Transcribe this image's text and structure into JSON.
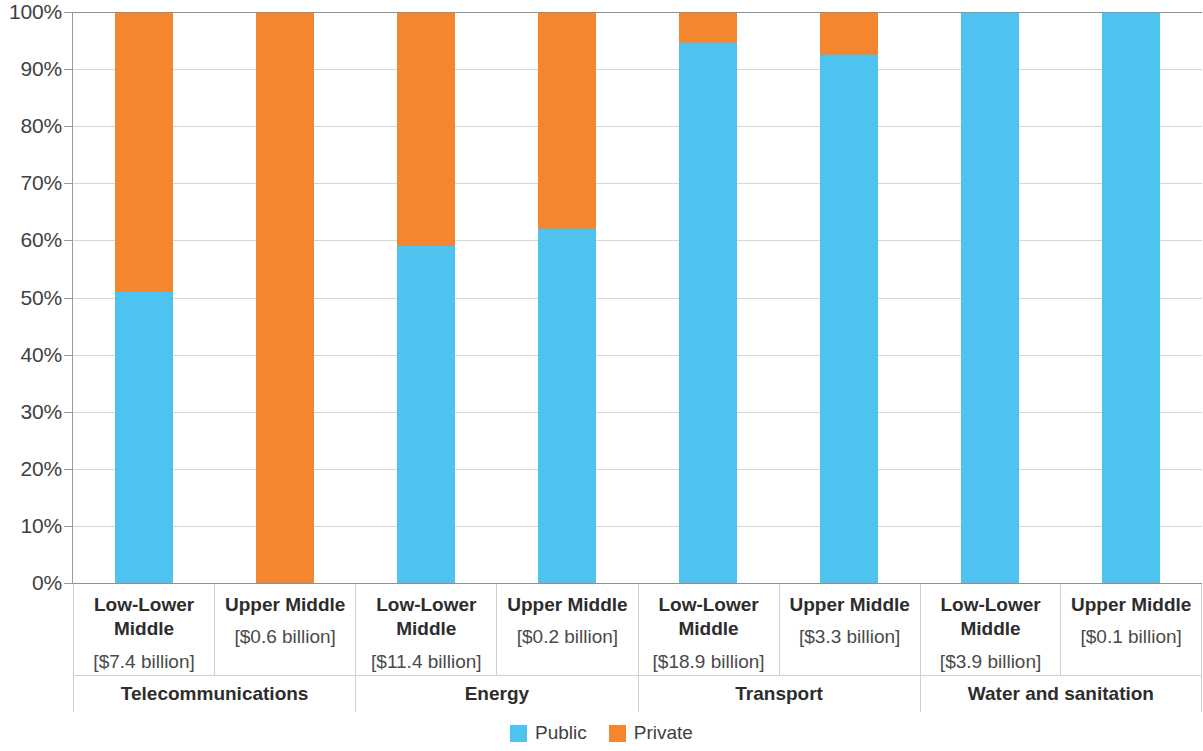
{
  "chart_data": {
    "type": "bar",
    "subtype": "stacked-100-percent",
    "title": "",
    "xlabel": "",
    "ylabel": "",
    "ylim": [
      0,
      100
    ],
    "grid": true,
    "legend_position": "bottom",
    "y_tick_labels": [
      "100%",
      "90%",
      "80%",
      "70%",
      "60%",
      "50%",
      "40%",
      "30%",
      "20%",
      "10%",
      "0%"
    ],
    "y_tick_values": [
      100,
      90,
      80,
      70,
      60,
      50,
      40,
      30,
      20,
      10,
      0
    ],
    "categories": [
      "Low-Lower Middle",
      "Upper Middle",
      "Low-Lower Middle",
      "Upper Middle",
      "Low-Lower Middle",
      "Upper Middle",
      "Low-Lower Middle",
      "Upper Middle"
    ],
    "series": [
      {
        "name": "Public",
        "color": "#4fc3ef",
        "values": [
          51,
          0,
          59,
          62,
          94.5,
          92.5,
          100,
          100
        ]
      },
      {
        "name": "Private",
        "color": "#f4862f",
        "values": [
          49,
          100,
          41,
          38,
          5.5,
          7.5,
          0,
          0
        ]
      }
    ],
    "annotations": [
      "[$7.4 billion]",
      "[$0.6 billion]",
      "[$11.4 billion]",
      "[$0.2 billion]",
      "[$18.9 billion]",
      "[$3.3 billion]",
      "[$3.9 billion]",
      "[$0.1 billion]"
    ]
  },
  "colors": {
    "public": "#4fc3ef",
    "private": "#f4862f",
    "gridline": "#d6d6d6",
    "axis": "#8f8f8f",
    "text": "#3f3f3f"
  },
  "legend": {
    "items": [
      {
        "label": "Public",
        "color": "#4fc3ef"
      },
      {
        "label": "Private",
        "color": "#f4862f"
      }
    ]
  },
  "groups": [
    {
      "name": "Telecommunications",
      "subgroups": [
        {
          "name": "Low-Lower Middle",
          "amount": "[$7.4 billion]",
          "public": 51,
          "private": 49
        },
        {
          "name": "Upper Middle",
          "amount": "[$0.6 billion]",
          "public": 0,
          "private": 100
        }
      ]
    },
    {
      "name": "Energy",
      "subgroups": [
        {
          "name": "Low-Lower Middle",
          "amount": "[$11.4 billion]",
          "public": 59,
          "private": 41
        },
        {
          "name": "Upper Middle",
          "amount": "[$0.2 billion]",
          "public": 62,
          "private": 38
        }
      ]
    },
    {
      "name": "Transport",
      "subgroups": [
        {
          "name": "Low-Lower Middle",
          "amount": "[$18.9 billion]",
          "public": 94.5,
          "private": 5.5
        },
        {
          "name": "Upper Middle",
          "amount": "[$3.3 billion]",
          "public": 92.5,
          "private": 7.5
        }
      ]
    },
    {
      "name": "Water and sanitation",
      "subgroups": [
        {
          "name": "Low-Lower Middle",
          "amount": "[$3.9 billion]",
          "public": 100,
          "private": 0
        },
        {
          "name": "Upper Middle",
          "amount": "[$0.1 billion]",
          "public": 100,
          "private": 0
        }
      ]
    }
  ]
}
